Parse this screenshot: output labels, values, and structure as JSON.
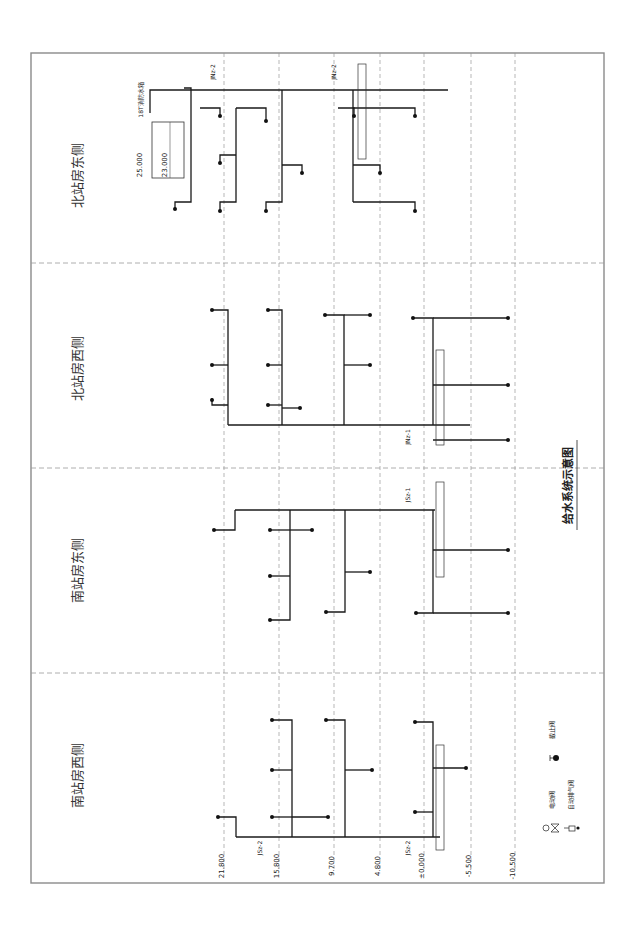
{
  "drawing": {
    "title": "给水系统示意图",
    "orientation": "rotated-90-ccw",
    "frame": {
      "x": 31,
      "y": 53,
      "w": 573,
      "h": 830
    }
  },
  "sections": [
    {
      "id": "north-east",
      "title": "北站房东侧",
      "y0": 53,
      "y1": 263
    },
    {
      "id": "north-west",
      "title": "北站房西侧",
      "y0": 263,
      "y1": 468
    },
    {
      "id": "south-east",
      "title": "南站房东侧",
      "y0": 468,
      "y1": 673
    },
    {
      "id": "south-west",
      "title": "南站房西侧",
      "y0": 673,
      "y1": 883
    }
  ],
  "levels": [
    {
      "x": 224,
      "elevation": "21.800",
      "note": "屋面一夹层"
    },
    {
      "x": 279,
      "elevation": "15.800",
      "note": "夹层顶面"
    },
    {
      "x": 334,
      "elevation": "9.700",
      "note": "高架候车层"
    },
    {
      "x": 380,
      "elevation": "4.800",
      "note": "站台层"
    },
    {
      "x": 424,
      "elevation": "±0.000",
      "note": "基本站台层"
    },
    {
      "x": 471,
      "elevation": "-5.500",
      "note": "出站层"
    },
    {
      "x": 515,
      "elevation": "-10.500",
      "note": "设备层"
    }
  ],
  "tank": {
    "label": "18T消防水箱",
    "elev_top": "25.000",
    "elev_water": "23.000"
  },
  "risers": [
    {
      "id": "JNz-2-a",
      "label": "JNz-2"
    },
    {
      "id": "JNz-2-b",
      "label": "JNz-2"
    },
    {
      "id": "JNz-1",
      "label": "JNz-1"
    },
    {
      "id": "JSz-1",
      "label": "JSz-1"
    },
    {
      "id": "JSz-2-a",
      "label": "JSz-2"
    },
    {
      "id": "JSz-2-b",
      "label": "JSz-2"
    }
  ],
  "pipe_sizes": [
    "DN100",
    "DN80",
    "DN65",
    "DN50",
    "De63",
    "De50",
    "De40",
    "De32",
    "DN40"
  ],
  "branch_labels": {
    "roof_toilet": "接楼面一夹层 屋面用水",
    "ac_room": "接楼面夹层 空调机房用水",
    "restroom": "接楼面夹层 卫生间用水",
    "waiting_restroom": "接候车层夹层 卫生间用水",
    "platform_restroom": "接站台层 卫生间用水",
    "platform_ac": "接站台层 空调机房用水",
    "basement_restroom": "接出站层 卫生间用水",
    "basement_water": "接出站层 水泵房等用水",
    "fire_riser": "接北站房侧综合管廊内消防主上水环管",
    "fire_riser_south": "接南站房侧综合管廊内消防主上水环管",
    "kitchen": "接候车层夹层 餐厅用水",
    "vip": "接候车层 贵宾厅用水"
  },
  "legend": {
    "items": [
      {
        "symbol": "stop-valve",
        "label": "截止阀"
      },
      {
        "symbol": "motorized-valve",
        "label": "电动阀"
      },
      {
        "symbol": "air-release-valve",
        "label": "自动排气阀"
      }
    ]
  }
}
